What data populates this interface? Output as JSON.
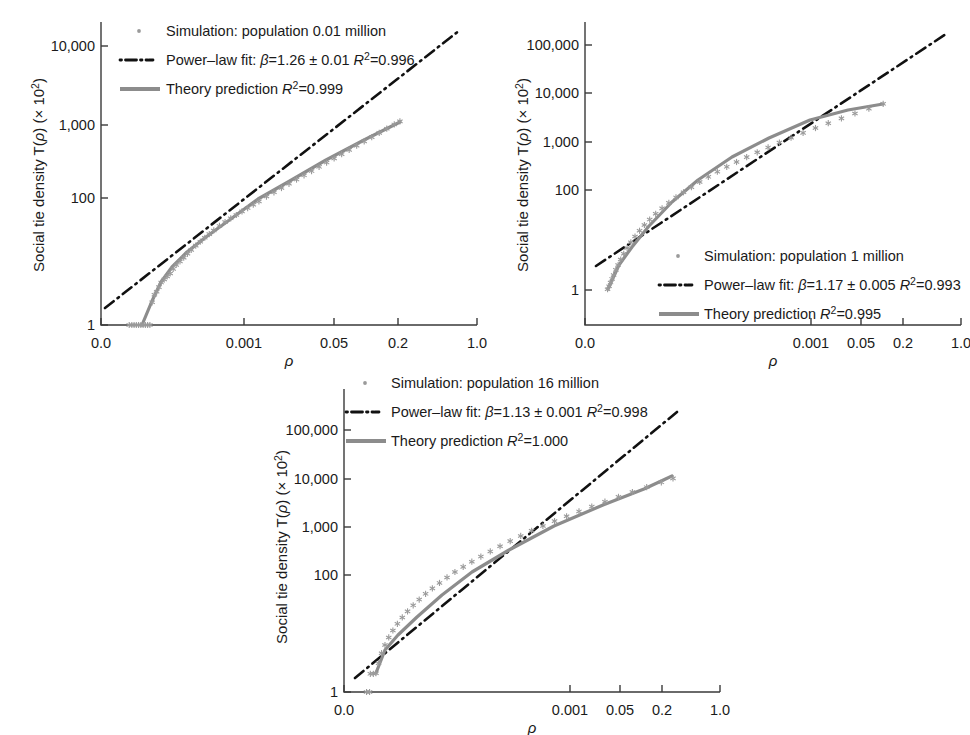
{
  "figure": {
    "axis_titles": {
      "y_prefix": "Social tie density T(",
      "y_rho": "ρ",
      "y_mid": ") (× 10",
      "y_exp": "2",
      "y_suffix": ")",
      "x": "ρ"
    }
  },
  "chart_data": [
    {
      "type": "scatter",
      "panel_id": "panel-1",
      "title": "",
      "xlabel": "ρ",
      "ylabel": "Social tie density T(ρ) (× 10²)",
      "xscale": "log",
      "yscale": "log",
      "xtick_labels": [
        "0.0",
        "0.001",
        "0.05",
        "0.2",
        "1.0"
      ],
      "xtick_positions": [
        0.0,
        0.38,
        0.62,
        0.79,
        1.0
      ],
      "ytick_labels": [
        "1",
        "100",
        "1,000",
        "10,000"
      ],
      "ytick_positions": [
        0.0,
        0.42,
        0.66,
        0.92
      ],
      "grid": false,
      "legend_position": "upper-left",
      "legend": [
        {
          "marker": "dot",
          "label": "Simulation: population 0.01 million"
        },
        {
          "marker": "dashdot",
          "label_prefix": "Power–law fit: ",
          "beta_sym": "β",
          "beta": "=1.26 ± 0.01 ",
          "r_sym": "R",
          "r_exp": "2",
          "r_val": "=0.996"
        },
        {
          "marker": "line",
          "label_prefix": "Theory prediction ",
          "r_sym": "R",
          "r_exp": "2",
          "r_val": "=0.999"
        }
      ],
      "series": [
        {
          "name": "Simulation: population 0.01 million",
          "comment": "normalized plot-area coords, x right 0..1, y up 0..1",
          "points_x": [
            0.075,
            0.082,
            0.088,
            0.094,
            0.1,
            0.106,
            0.112,
            0.118,
            0.124,
            0.13,
            0.136,
            0.142,
            0.148,
            0.154,
            0.16,
            0.168,
            0.176,
            0.184,
            0.192,
            0.2,
            0.21,
            0.22,
            0.23,
            0.24,
            0.252,
            0.264,
            0.276,
            0.288,
            0.3,
            0.315,
            0.33,
            0.345,
            0.36,
            0.375,
            0.39,
            0.405,
            0.42,
            0.44,
            0.46,
            0.48,
            0.5,
            0.52,
            0.54,
            0.56,
            0.58,
            0.6,
            0.62,
            0.64,
            0.66,
            0.68,
            0.7,
            0.72,
            0.74,
            0.76,
            0.78,
            0.795
          ],
          "points_y": [
            0.0,
            0.0,
            0.0,
            0.0,
            0.0,
            0.0,
            0.0,
            0.0,
            0.0,
            0.0,
            0.075,
            0.1,
            0.11,
            0.125,
            0.14,
            0.15,
            0.16,
            0.17,
            0.185,
            0.198,
            0.21,
            0.222,
            0.235,
            0.248,
            0.262,
            0.275,
            0.288,
            0.3,
            0.312,
            0.327,
            0.34,
            0.352,
            0.363,
            0.375,
            0.386,
            0.397,
            0.408,
            0.424,
            0.438,
            0.452,
            0.466,
            0.48,
            0.494,
            0.508,
            0.522,
            0.536,
            0.55,
            0.564,
            0.578,
            0.592,
            0.606,
            0.62,
            0.634,
            0.648,
            0.662,
            0.672
          ]
        },
        {
          "name": "Theory prediction",
          "points_x": [
            0.108,
            0.136,
            0.16,
            0.19,
            0.23,
            0.28,
            0.34,
            0.42,
            0.5,
            0.6,
            0.7,
            0.795
          ],
          "points_y": [
            0.0,
            0.078,
            0.14,
            0.19,
            0.238,
            0.288,
            0.34,
            0.41,
            0.47,
            0.545,
            0.612,
            0.672
          ]
        },
        {
          "name": "Power-law fit",
          "x_from": 0.012,
          "x_to": 0.955,
          "y_from": 0.055,
          "y_to": 0.96
        }
      ]
    },
    {
      "type": "scatter",
      "panel_id": "panel-2",
      "title": "",
      "xlabel": "ρ",
      "ylabel": "Social tie density T(ρ) (× 10²)",
      "xscale": "log",
      "yscale": "log",
      "xtick_labels": [
        "0.0",
        "0.001",
        "0.05",
        "0.2",
        "1.0"
      ],
      "xtick_positions": [
        0.0,
        0.6,
        0.735,
        0.845,
        1.0
      ],
      "ytick_labels": [
        "1",
        "100",
        "1,000",
        "10,000",
        "100,000"
      ],
      "ytick_positions": [
        0.115,
        0.445,
        0.605,
        0.765,
        0.925
      ],
      "grid": false,
      "legend_position": "lower-right",
      "legend": [
        {
          "marker": "dot",
          "label": "Simulation: population 1 million"
        },
        {
          "marker": "dashdot",
          "label_prefix": "Power–law fit: ",
          "beta_sym": "β",
          "beta": "=1.17 ± 0.005 ",
          "r_sym": "R",
          "r_exp": "2",
          "r_val": "=0.993"
        },
        {
          "marker": "line",
          "label_prefix": "Theory prediction ",
          "r_sym": "R",
          "r_exp": "2",
          "r_val": "=0.995"
        }
      ],
      "series": [
        {
          "name": "Simulation: population 1 million",
          "points_x": [
            0.06,
            0.064,
            0.068,
            0.072,
            0.076,
            0.082,
            0.088,
            0.095,
            0.103,
            0.112,
            0.122,
            0.133,
            0.145,
            0.158,
            0.172,
            0.188,
            0.205,
            0.223,
            0.242,
            0.262,
            0.283,
            0.305,
            0.328,
            0.352,
            0.377,
            0.403,
            0.43,
            0.458,
            0.487,
            0.517,
            0.548,
            0.58,
            0.613,
            0.647,
            0.682,
            0.718,
            0.755,
            0.793
          ],
          "points_y": [
            0.118,
            0.128,
            0.14,
            0.152,
            0.165,
            0.182,
            0.198,
            0.216,
            0.235,
            0.254,
            0.273,
            0.292,
            0.311,
            0.33,
            0.348,
            0.367,
            0.385,
            0.403,
            0.421,
            0.438,
            0.455,
            0.472,
            0.489,
            0.506,
            0.522,
            0.538,
            0.554,
            0.57,
            0.586,
            0.602,
            0.618,
            0.634,
            0.65,
            0.666,
            0.682,
            0.698,
            0.714,
            0.73
          ]
        },
        {
          "name": "Theory prediction",
          "points_x": [
            0.062,
            0.09,
            0.125,
            0.17,
            0.23,
            0.3,
            0.39,
            0.49,
            0.6,
            0.7,
            0.793
          ],
          "points_y": [
            0.12,
            0.2,
            0.258,
            0.328,
            0.408,
            0.48,
            0.556,
            0.618,
            0.68,
            0.712,
            0.73
          ]
        },
        {
          "name": "Power-law fit",
          "x_from": 0.03,
          "x_to": 0.96,
          "y_from": 0.195,
          "y_to": 0.93
        }
      ]
    },
    {
      "type": "scatter",
      "panel_id": "panel-3",
      "title": "",
      "xlabel": "ρ",
      "ylabel": "Social tie density T(ρ) (× 10²)",
      "xscale": "log",
      "yscale": "log",
      "xtick_labels": [
        "0.0",
        "0.001",
        "0.05",
        "0.2",
        "1.0"
      ],
      "xtick_positions": [
        0.0,
        0.6,
        0.735,
        0.845,
        1.0
      ],
      "ytick_labels": [
        "1",
        "100",
        "1,000",
        "10,000",
        "100,000"
      ],
      "ytick_positions": [
        0.0,
        0.385,
        0.545,
        0.705,
        0.865
      ],
      "grid": false,
      "legend_position": "upper-left",
      "legend": [
        {
          "marker": "dot",
          "label": "Simulation: population 16 million"
        },
        {
          "marker": "dashdot",
          "label_prefix": "Power–law fit: ",
          "beta_sym": "β",
          "beta": "=1.13 ± 0.001 ",
          "r_sym": "R",
          "r_exp": "2",
          "r_val": "=0.998"
        },
        {
          "marker": "line",
          "label_prefix": "Theory prediction ",
          "r_sym": "R",
          "r_exp": "2",
          "r_val": "=1.000"
        }
      ],
      "series": [
        {
          "name": "Simulation: population 16 million",
          "points_x": [
            0.085,
            0.092,
            0.1,
            0.109,
            0.119,
            0.13,
            0.142,
            0.155,
            0.169,
            0.184,
            0.2,
            0.217,
            0.235,
            0.254,
            0.274,
            0.295,
            0.317,
            0.34,
            0.364,
            0.389,
            0.415,
            0.442,
            0.47,
            0.499,
            0.529,
            0.56,
            0.592,
            0.625,
            0.659,
            0.694,
            0.73,
            0.767,
            0.805,
            0.844,
            0.875
          ],
          "points_y": [
            0.062,
            0.095,
            0.128,
            0.155,
            0.18,
            0.203,
            0.225,
            0.246,
            0.266,
            0.286,
            0.305,
            0.324,
            0.342,
            0.36,
            0.378,
            0.396,
            0.413,
            0.43,
            0.447,
            0.464,
            0.481,
            0.498,
            0.515,
            0.532,
            0.548,
            0.564,
            0.58,
            0.596,
            0.612,
            0.628,
            0.644,
            0.66,
            0.676,
            0.692,
            0.705
          ]
        },
        {
          "name": "outliers",
          "points_x": [
            0.07,
            0.078,
            0.06,
            0.068
          ],
          "points_y": [
            0.06,
            0.06,
            0.0,
            0.0
          ]
        },
        {
          "name": "Theory prediction",
          "points_x": [
            0.086,
            0.11,
            0.145,
            0.195,
            0.26,
            0.34,
            0.44,
            0.56,
            0.69,
            0.8,
            0.875
          ],
          "points_y": [
            0.063,
            0.14,
            0.19,
            0.25,
            0.32,
            0.395,
            0.47,
            0.55,
            0.62,
            0.672,
            0.705
          ]
        },
        {
          "name": "Power-law fit",
          "x_from": 0.03,
          "x_to": 0.885,
          "y_from": 0.045,
          "y_to": 0.715
        }
      ]
    }
  ],
  "colors": {
    "marker": "#9a9a9a",
    "theory": "#8c8c8c",
    "fit": "#111111",
    "axis": "#3a3a3a",
    "text": "#1a1a1a"
  }
}
